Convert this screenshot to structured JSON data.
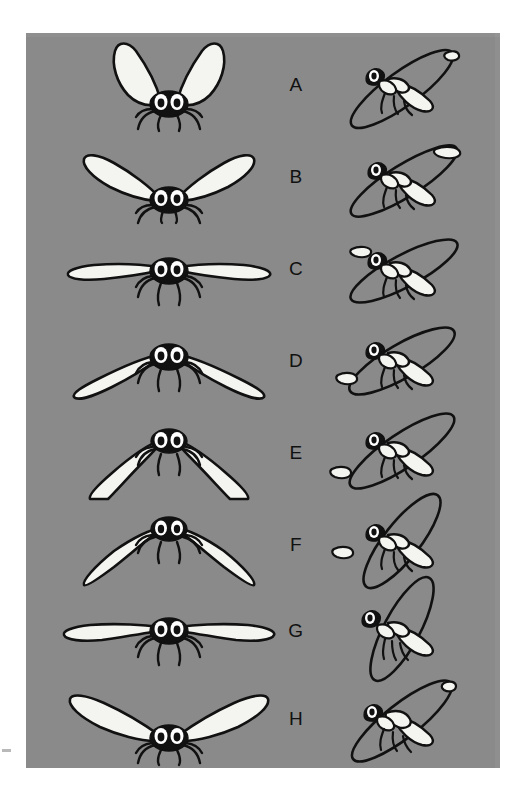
{
  "figure": {
    "type": "scientific-illustration",
    "panel": {
      "background_color": "#8a8a8a",
      "page_background_color": "#ffffff",
      "ink_color": "#111111",
      "wing_fill_color": "#f4f4f0"
    },
    "label_count": 8,
    "columns": [
      {
        "name": "front-view",
        "position": "left"
      },
      {
        "name": "stage-label",
        "position": "center"
      },
      {
        "name": "side-view",
        "position": "right"
      }
    ]
  },
  "rows": [
    {
      "label": "A",
      "stage": "top-of-upstroke",
      "front": {
        "wing_angle_deg": -72,
        "wing_length": 78,
        "wing_curve": "high-v"
      },
      "side": {
        "wing_angle_deg": -46,
        "ellipse_rotation_deg": -36,
        "tip_position": "top-rear"
      }
    },
    {
      "label": "B",
      "stage": "early-downstroke",
      "front": {
        "wing_angle_deg": -28,
        "wing_length": 88,
        "wing_curve": "raised"
      },
      "side": {
        "wing_angle_deg": -30,
        "ellipse_rotation_deg": -32,
        "tip_position": "upper-rear"
      }
    },
    {
      "label": "C",
      "stage": "mid-downstroke",
      "front": {
        "wing_angle_deg": -2,
        "wing_length": 95,
        "wing_curve": "horizontal"
      },
      "side": {
        "wing_angle_deg": -8,
        "ellipse_rotation_deg": -28,
        "tip_position": "mid-rear"
      }
    },
    {
      "label": "D",
      "stage": "late-downstroke",
      "front": {
        "wing_angle_deg": 16,
        "wing_length": 92,
        "wing_curve": "lowered"
      },
      "side": {
        "wing_angle_deg": 12,
        "ellipse_rotation_deg": -30,
        "tip_position": "lower-front"
      }
    },
    {
      "label": "E",
      "stage": "bottom-of-downstroke",
      "front": {
        "wing_angle_deg": 42,
        "wing_length": 86,
        "wing_curve": "deep-arc"
      },
      "side": {
        "wing_angle_deg": 22,
        "ellipse_rotation_deg": -34,
        "tip_position": "bottom-front"
      }
    },
    {
      "label": "F",
      "stage": "stroke-reversal",
      "front": {
        "wing_angle_deg": 52,
        "wing_length": 84,
        "wing_curve": "inverted-v"
      },
      "side": {
        "wing_angle_deg": 26,
        "ellipse_rotation_deg": -52,
        "tip_position": "bottom-front"
      }
    },
    {
      "label": "G",
      "stage": "mid-upstroke",
      "front": {
        "wing_angle_deg": 4,
        "wing_length": 96,
        "wing_curve": "horizontal"
      },
      "side": {
        "wing_angle_deg": -4,
        "ellipse_rotation_deg": -62,
        "tip_position": "mid-vertical"
      }
    },
    {
      "label": "H",
      "stage": "late-upstroke",
      "front": {
        "wing_angle_deg": -24,
        "wing_length": 92,
        "wing_curve": "raised"
      },
      "side": {
        "wing_angle_deg": -42,
        "ellipse_rotation_deg": -38,
        "tip_position": "upper-rear"
      }
    }
  ]
}
